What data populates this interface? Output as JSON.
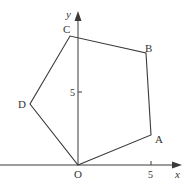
{
  "diagram": {
    "type": "coordinate-geometry",
    "axes": {
      "x_label": "x",
      "y_label": "y",
      "origin_label": "O",
      "x_tick": {
        "value": 5,
        "label": "5"
      },
      "y_tick": {
        "value": 5,
        "label": "5"
      }
    },
    "vertices": [
      {
        "name": "O",
        "label": "O",
        "x": 0,
        "y": 0
      },
      {
        "name": "A",
        "label": "A",
        "x": 5,
        "y": 2
      },
      {
        "name": "B",
        "label": "B",
        "x": 4.7,
        "y": 7.7
      },
      {
        "name": "C",
        "label": "C",
        "x": -0.5,
        "y": 8.8
      },
      {
        "name": "D",
        "label": "D",
        "x": -3.3,
        "y": 4.2
      }
    ],
    "polygon_order": [
      "O",
      "A",
      "B",
      "C",
      "D"
    ],
    "colors": {
      "line": "#3a3a3a",
      "background": "#ffffff",
      "text": "#333333"
    }
  }
}
